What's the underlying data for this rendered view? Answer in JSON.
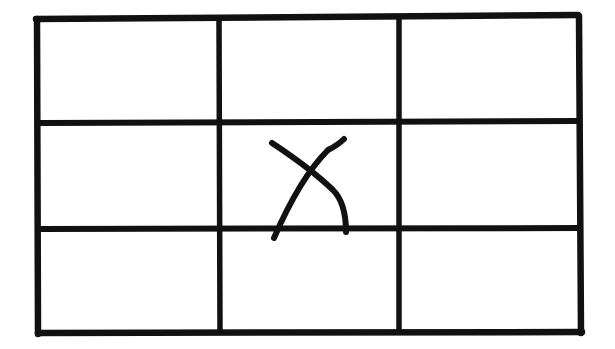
{
  "diagram": {
    "type": "grid",
    "rows": 3,
    "columns": 3,
    "stroke_color": "#111111",
    "background_color": "#ffffff",
    "outer_frame": {
      "x1": 38,
      "y1": 18,
      "x2": 580,
      "y2": 334
    },
    "vertical_lines_x": [
      219,
      399
    ],
    "horizontal_lines_y": [
      123,
      229
    ],
    "cells": [
      {
        "row": 0,
        "col": 0,
        "mark": ""
      },
      {
        "row": 0,
        "col": 1,
        "mark": ""
      },
      {
        "row": 0,
        "col": 2,
        "mark": ""
      },
      {
        "row": 1,
        "col": 0,
        "mark": ""
      },
      {
        "row": 1,
        "col": 1,
        "mark": "X"
      },
      {
        "row": 1,
        "col": 2,
        "mark": ""
      },
      {
        "row": 2,
        "col": 0,
        "mark": ""
      },
      {
        "row": 2,
        "col": 1,
        "mark": ""
      },
      {
        "row": 2,
        "col": 2,
        "mark": ""
      }
    ],
    "marked_cell": {
      "row": 1,
      "col": 1,
      "symbol": "X",
      "icon": "x-mark-icon"
    }
  }
}
